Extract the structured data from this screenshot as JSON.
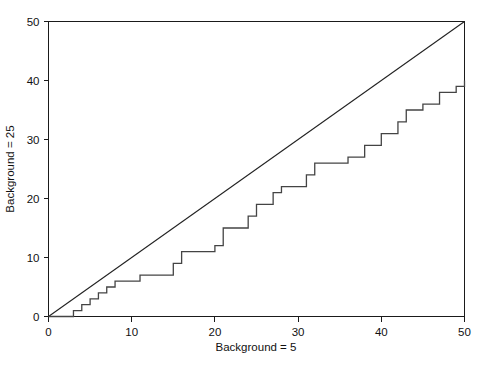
{
  "chart_data": {
    "type": "line",
    "title": "",
    "xlabel": "Background = 5",
    "ylabel": "Background = 25",
    "xlim": [
      0,
      50
    ],
    "ylim": [
      0,
      50
    ],
    "xticks": [
      0,
      10,
      20,
      30,
      40,
      50
    ],
    "yticks": [
      0,
      10,
      20,
      30,
      40,
      50
    ],
    "xticklabels": [
      "0",
      "10",
      "20",
      "30",
      "40",
      "50"
    ],
    "yticklabels": [
      "0",
      "10",
      "20",
      "30",
      "40",
      "50"
    ],
    "grid": false,
    "legend": "none",
    "axis_style": "open-left-bottom-with-top-right-frame",
    "series": [
      {
        "name": "identity-reference-line",
        "style": "straight-line",
        "color": "#222222",
        "x": [
          0,
          50
        ],
        "values": [
          0,
          50
        ]
      },
      {
        "name": "step-function",
        "style": "step-post",
        "color": "#444444",
        "x": [
          0,
          3,
          4,
          5,
          6,
          7,
          8,
          11,
          15,
          16,
          20,
          21,
          24,
          25,
          27,
          28,
          31,
          32,
          36,
          38,
          40,
          42,
          43,
          45,
          47,
          49,
          50
        ],
        "values": [
          0,
          1,
          2,
          3,
          4,
          5,
          6,
          7,
          9,
          11,
          12,
          15,
          17,
          19,
          21,
          22,
          24,
          26,
          27,
          29,
          31,
          33,
          35,
          36,
          38,
          39,
          40
        ]
      }
    ]
  },
  "axes": {
    "x_title": "Background = 5",
    "y_title": "Background = 25"
  }
}
